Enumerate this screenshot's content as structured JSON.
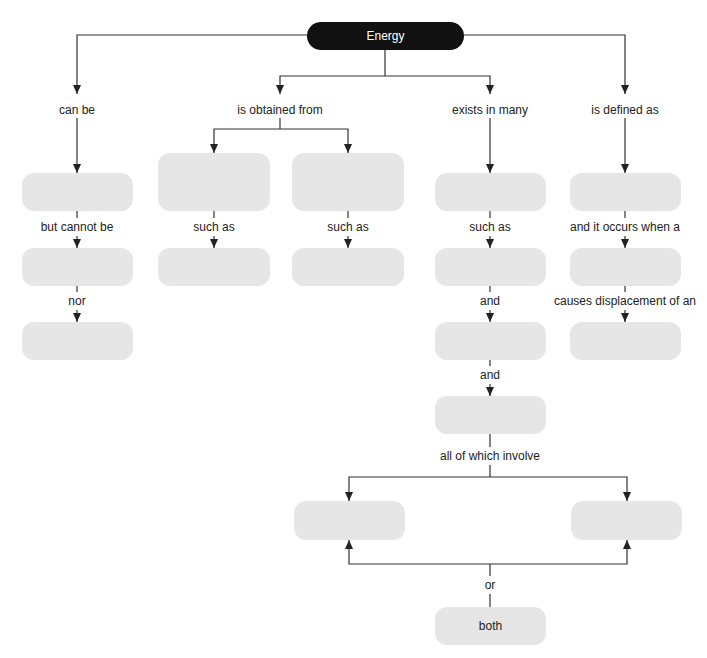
{
  "diagram": {
    "type": "concept-map",
    "root": {
      "label": "Energy"
    },
    "branches": [
      {
        "link": "can be",
        "chain": [
          {
            "node": "",
            "link_after": "but cannot be"
          },
          {
            "node": "",
            "link_after": "nor"
          },
          {
            "node": ""
          }
        ]
      },
      {
        "link": "is obtained from",
        "children": [
          {
            "node": "",
            "link_after": "such as",
            "next": ""
          },
          {
            "node": "",
            "link_after": "such as",
            "next": ""
          }
        ]
      },
      {
        "link": "exists in many",
        "chain": [
          {
            "node": "",
            "link_after": "such as"
          },
          {
            "node": "",
            "link_after": "and"
          },
          {
            "node": "",
            "link_after": "and"
          },
          {
            "node": "",
            "link_after": "all of which involve"
          }
        ],
        "involve": [
          {
            "node": ""
          },
          {
            "node": ""
          }
        ],
        "connector": "or",
        "both": "both"
      },
      {
        "link": "is defined as",
        "chain": [
          {
            "node": "",
            "link_after": "and it occurs when a"
          },
          {
            "node": "",
            "link_after": "causes displacement of an"
          },
          {
            "node": ""
          }
        ]
      }
    ]
  },
  "colors": {
    "root_fill": "#111111",
    "root_text": "#ffffff",
    "node_fill": "#e6e6e6",
    "line": "#333333"
  }
}
